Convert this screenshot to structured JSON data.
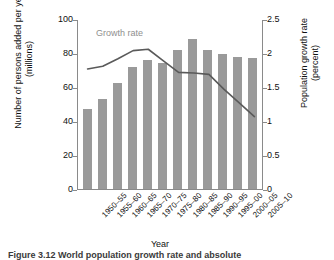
{
  "chart_data": {
    "type": "bar",
    "title": "",
    "xlabel": "Year",
    "ylabel": "Number of persons added per year\n(millions)",
    "y2label": "Population growth rate\n(percent)",
    "categories": [
      "1950–55",
      "1955–60",
      "1960–65",
      "1965–70",
      "1970–75",
      "1975–80",
      "1980–85",
      "1985–90",
      "1990–95",
      "1995–00",
      "2000–05",
      "2005–10"
    ],
    "ylim": [
      0,
      100
    ],
    "yticks": [
      "0",
      "20",
      "40",
      "60",
      "80",
      "100"
    ],
    "y2lim": [
      0,
      2.5
    ],
    "y2ticks": [
      "0",
      "0.5",
      "1",
      "1.5",
      "2",
      "2.5"
    ],
    "grid": false,
    "legend": "annotation-inline",
    "annotations": [
      {
        "text": "Growth rate",
        "series": "growth_rate"
      }
    ],
    "series": [
      {
        "name": "Number of persons added per year (millions)",
        "type": "bar",
        "axis": "left",
        "color": "#9a9a9a",
        "values": [
          47,
          53,
          62.5,
          72,
          76,
          74,
          82,
          88,
          82,
          79.5,
          77.5,
          77
        ]
      },
      {
        "name": "Growth rate",
        "type": "line",
        "axis": "right",
        "color": "#5a5a5a",
        "values": [
          1.78,
          1.82,
          1.93,
          2.05,
          2.07,
          1.9,
          1.73,
          1.72,
          1.7,
          1.48,
          1.28,
          1.08
        ]
      }
    ]
  },
  "annotation": {
    "growth_rate_label": "Growth rate"
  },
  "caption": {
    "text": "Figure 3.12 World population growth rate and absolute"
  }
}
